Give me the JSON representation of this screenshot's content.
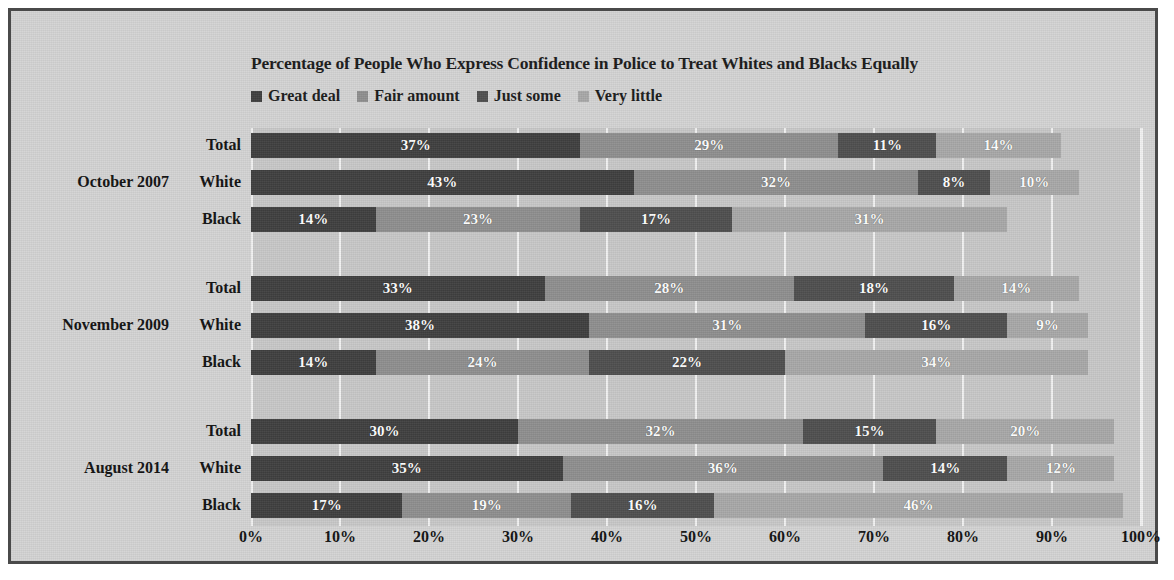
{
  "chart_data": {
    "type": "bar",
    "orientation": "horizontal",
    "stacked": true,
    "title": "Percentage of People Who Express Confidence in Police to Treat Whites and Blacks Equally",
    "xlabel": "",
    "ylabel": "",
    "xlim": [
      0,
      100
    ],
    "grid": true,
    "legend_position": "top-left",
    "xticks": [
      "0%",
      "10%",
      "20%",
      "30%",
      "40%",
      "50%",
      "60%",
      "70%",
      "80%",
      "90%",
      "100%"
    ],
    "legend": [
      "Great deal",
      "Fair amount",
      "Just some",
      "Very little"
    ],
    "series": [
      {
        "name": "Great deal",
        "color": "#3f3f3f",
        "values": [
          37,
          43,
          14,
          33,
          38,
          14,
          30,
          35,
          17
        ]
      },
      {
        "name": "Fair amount",
        "color": "#8f8f8f",
        "values": [
          29,
          32,
          23,
          28,
          31,
          24,
          32,
          36,
          19
        ]
      },
      {
        "name": "Just some",
        "color": "#4f4f4f",
        "values": [
          11,
          8,
          17,
          18,
          16,
          22,
          15,
          14,
          16
        ]
      },
      {
        "name": "Very little",
        "color": "#a8a8a8",
        "values": [
          14,
          10,
          31,
          14,
          9,
          34,
          20,
          12,
          46
        ]
      }
    ],
    "categories": [
      "Total",
      "White",
      "Black",
      "Total",
      "White",
      "Black",
      "Total",
      "White",
      "Black"
    ],
    "groups": [
      {
        "label": "October 2007",
        "rows": [
          "Total",
          "White",
          "Black"
        ]
      },
      {
        "label": "November 2009",
        "rows": [
          "Total",
          "White",
          "Black"
        ]
      },
      {
        "label": "August 2014",
        "rows": [
          "Total",
          "White",
          "Black"
        ]
      }
    ],
    "bars": [
      {
        "group": "October 2007",
        "category": "Total",
        "segments": [
          {
            "series": "Great deal",
            "value": 37,
            "label": "37%"
          },
          {
            "series": "Fair amount",
            "value": 29,
            "label": "29%"
          },
          {
            "series": "Just some",
            "value": 11,
            "label": "11%"
          },
          {
            "series": "Very little",
            "value": 14,
            "label": "14%"
          }
        ]
      },
      {
        "group": "October 2007",
        "category": "White",
        "segments": [
          {
            "series": "Great deal",
            "value": 43,
            "label": "43%"
          },
          {
            "series": "Fair amount",
            "value": 32,
            "label": "32%"
          },
          {
            "series": "Just some",
            "value": 8,
            "label": "8%"
          },
          {
            "series": "Very little",
            "value": 10,
            "label": "10%"
          }
        ]
      },
      {
        "group": "October 2007",
        "category": "Black",
        "segments": [
          {
            "series": "Great deal",
            "value": 14,
            "label": "14%"
          },
          {
            "series": "Fair amount",
            "value": 23,
            "label": "23%"
          },
          {
            "series": "Just some",
            "value": 17,
            "label": "17%"
          },
          {
            "series": "Very little",
            "value": 31,
            "label": "31%"
          }
        ]
      },
      {
        "group": "November 2009",
        "category": "Total",
        "segments": [
          {
            "series": "Great deal",
            "value": 33,
            "label": "33%"
          },
          {
            "series": "Fair amount",
            "value": 28,
            "label": "28%"
          },
          {
            "series": "Just some",
            "value": 18,
            "label": "18%"
          },
          {
            "series": "Very little",
            "value": 14,
            "label": "14%"
          }
        ]
      },
      {
        "group": "November 2009",
        "category": "White",
        "segments": [
          {
            "series": "Great deal",
            "value": 38,
            "label": "38%"
          },
          {
            "series": "Fair amount",
            "value": 31,
            "label": "31%"
          },
          {
            "series": "Just some",
            "value": 16,
            "label": "16%"
          },
          {
            "series": "Very little",
            "value": 9,
            "label": "9%"
          }
        ]
      },
      {
        "group": "November 2009",
        "category": "Black",
        "segments": [
          {
            "series": "Great deal",
            "value": 14,
            "label": "14%"
          },
          {
            "series": "Fair amount",
            "value": 24,
            "label": "24%"
          },
          {
            "series": "Just some",
            "value": 22,
            "label": "22%"
          },
          {
            "series": "Very little",
            "value": 34,
            "label": "34%"
          }
        ]
      },
      {
        "group": "August 2014",
        "category": "Total",
        "segments": [
          {
            "series": "Great deal",
            "value": 30,
            "label": "30%"
          },
          {
            "series": "Fair amount",
            "value": 32,
            "label": "32%"
          },
          {
            "series": "Just some",
            "value": 15,
            "label": "15%"
          },
          {
            "series": "Very little",
            "value": 20,
            "label": "20%"
          }
        ]
      },
      {
        "group": "August 2014",
        "category": "White",
        "segments": [
          {
            "series": "Great deal",
            "value": 35,
            "label": "35%"
          },
          {
            "series": "Fair amount",
            "value": 36,
            "label": "36%"
          },
          {
            "series": "Just some",
            "value": 14,
            "label": "14%"
          },
          {
            "series": "Very little",
            "value": 12,
            "label": "12%"
          }
        ]
      },
      {
        "group": "August 2014",
        "category": "Black",
        "segments": [
          {
            "series": "Great deal",
            "value": 17,
            "label": "17%"
          },
          {
            "series": "Fair amount",
            "value": 19,
            "label": "19%"
          },
          {
            "series": "Just some",
            "value": 16,
            "label": "16%"
          },
          {
            "series": "Very little",
            "value": 46,
            "label": "46%"
          }
        ]
      }
    ]
  },
  "colors": {
    "page_background": "#ffffff",
    "panel_background": "#d4d4d4",
    "plot_background": "#c8c8c8",
    "border": "#4a4a4a",
    "gridline": "#f2f2f2",
    "text": "#111111",
    "data_label": "#ffffff"
  }
}
